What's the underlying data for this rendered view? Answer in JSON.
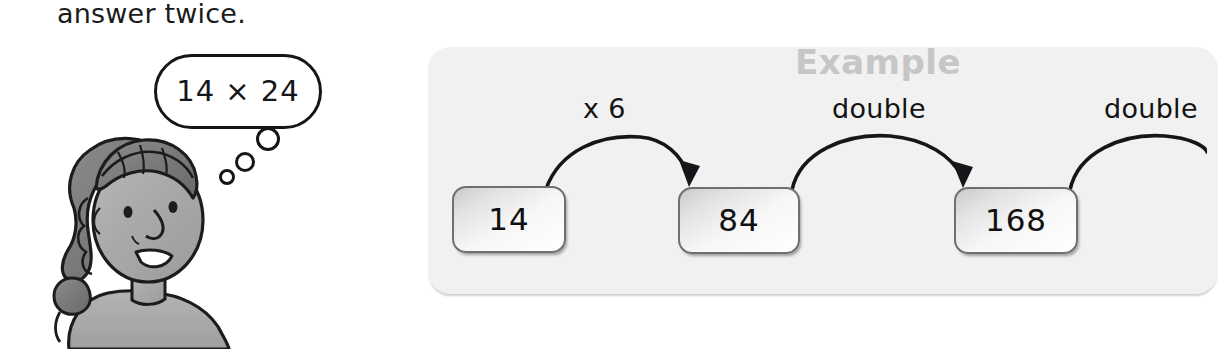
{
  "page": {
    "instruction_text": "answer twice."
  },
  "thought_bubble": {
    "expression": "14 × 24",
    "dots": [
      "large",
      "medium",
      "small"
    ]
  },
  "character": {
    "name": "student-illustration",
    "description": "girl-thinking"
  },
  "example_panel": {
    "label": "Example",
    "label_color": "#c6c6c6",
    "background_color": "#f1f1f1",
    "steps": [
      {
        "value": "14",
        "operation_to_next": "x 6"
      },
      {
        "value": "84",
        "operation_to_next": "double"
      },
      {
        "value": "168",
        "operation_to_next": "double"
      }
    ],
    "arrow_labels": [
      "x 6",
      "double",
      "double"
    ],
    "box_values": [
      "14",
      "84",
      "168"
    ]
  }
}
